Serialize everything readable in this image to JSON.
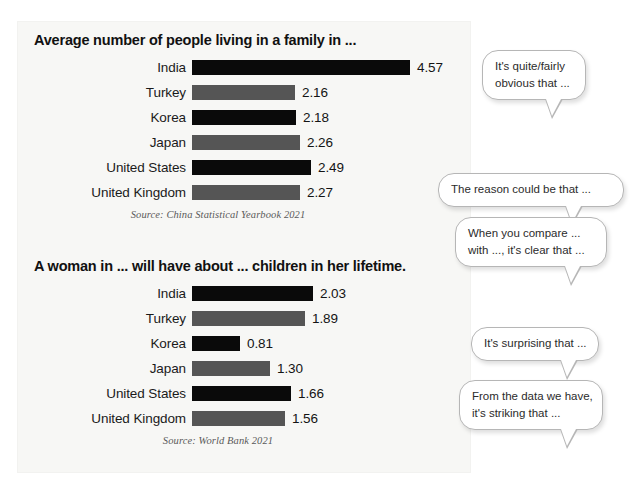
{
  "chart_data": [
    {
      "type": "bar",
      "title": "Average number of people living in a family in ...",
      "orientation": "horizontal",
      "categories": [
        "India",
        "Turkey",
        "Korea",
        "Japan",
        "United States",
        "United Kingdom"
      ],
      "values": [
        4.57,
        2.16,
        2.18,
        2.26,
        2.49,
        2.27
      ],
      "value_labels": [
        "4.57",
        "2.16",
        "2.18",
        "2.26",
        "2.49",
        "2.27"
      ],
      "bar_colors": [
        "#0a0a0a",
        "#555555",
        "#0a0a0a",
        "#555555",
        "#0a0a0a",
        "#555555"
      ],
      "source": "Source: China Statistical Yearbook 2021",
      "xlabel": "",
      "ylabel": "",
      "xlim": [
        0,
        4.57
      ],
      "grid": false,
      "legend": "none"
    },
    {
      "type": "bar",
      "title": "A woman in ... will have about ... children in her lifetime.",
      "orientation": "horizontal",
      "categories": [
        "India",
        "Turkey",
        "Korea",
        "Japan",
        "United States",
        "United Kingdom"
      ],
      "values": [
        2.03,
        1.89,
        0.81,
        1.3,
        1.66,
        1.56
      ],
      "value_labels": [
        "2.03",
        "1.89",
        "0.81",
        "1.30",
        "1.66",
        "1.56"
      ],
      "bar_colors": [
        "#0a0a0a",
        "#555555",
        "#0a0a0a",
        "#555555",
        "#0a0a0a",
        "#555555"
      ],
      "source": "Source: World Bank 2021",
      "xlabel": "",
      "ylabel": "",
      "xlim": [
        0,
        2.03
      ],
      "grid": false,
      "legend": "none"
    }
  ],
  "charts": [
    {
      "title": "Average number of people living in a family in ...",
      "source": "Source: China Statistical Yearbook 2021",
      "rows": [
        {
          "label": "India",
          "value": "4.57",
          "width": 218,
          "dark": true
        },
        {
          "label": "Turkey",
          "value": "2.16",
          "width": 103,
          "dark": false
        },
        {
          "label": "Korea",
          "value": "2.18",
          "width": 104,
          "dark": true
        },
        {
          "label": "Japan",
          "value": "2.26",
          "width": 108,
          "dark": false
        },
        {
          "label": "United States",
          "value": "2.49",
          "width": 119,
          "dark": true
        },
        {
          "label": "United Kingdom",
          "value": "2.27",
          "width": 108,
          "dark": false
        }
      ]
    },
    {
      "title": "A woman in ... will have about ... children in her lifetime.",
      "source": "Source: World Bank 2021",
      "rows": [
        {
          "label": "India",
          "value": "2.03",
          "width": 121,
          "dark": true
        },
        {
          "label": "Turkey",
          "value": "1.89",
          "width": 113,
          "dark": false
        },
        {
          "label": "Korea",
          "value": "0.81",
          "width": 48,
          "dark": true
        },
        {
          "label": "Japan",
          "value": "1.30",
          "width": 78,
          "dark": false
        },
        {
          "label": "United States",
          "value": "1.66",
          "width": 99,
          "dark": true
        },
        {
          "label": "United Kingdom",
          "value": "1.56",
          "width": 93,
          "dark": false
        }
      ]
    }
  ],
  "bubbles": [
    {
      "id": "bubble-1",
      "lines": [
        "It's quite/fairly",
        "obvious that ..."
      ]
    },
    {
      "id": "bubble-2",
      "lines": [
        "The reason could be that ..."
      ]
    },
    {
      "id": "bubble-3",
      "lines": [
        "When you compare ...",
        "with ..., it's clear that ..."
      ]
    },
    {
      "id": "bubble-4",
      "lines": [
        "It's surprising that ..."
      ]
    },
    {
      "id": "bubble-5",
      "lines": [
        "From the data we have,",
        "it's striking that ..."
      ]
    }
  ],
  "colors": {
    "bar_dark": "#0a0a0a",
    "bar_gray": "#555555",
    "panel_bg": "#f7f7f5",
    "bubble_border": "#b6b6b6",
    "source_text": "#5a5a5a"
  }
}
